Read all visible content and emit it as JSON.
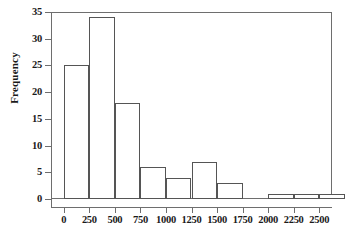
{
  "chart_data": {
    "type": "bar",
    "title": "",
    "subtitle": "",
    "xlabel": "",
    "ylabel": "Frequency",
    "grid": false,
    "legend": null,
    "bin_width": 250,
    "bin_starts": [
      0,
      250,
      500,
      750,
      1000,
      1250,
      1500,
      1750,
      2000,
      2250,
      2500
    ],
    "categories": [
      "0",
      "250",
      "500",
      "750",
      "1000",
      "1250",
      "1500",
      "1750",
      "2000",
      "2250",
      "2500"
    ],
    "values": [
      25,
      34,
      18,
      6,
      4,
      7,
      3,
      0,
      1,
      1,
      1
    ],
    "xlim": [
      -125,
      2625
    ],
    "ylim": [
      0,
      35
    ],
    "xticks": [
      0,
      250,
      500,
      750,
      1000,
      1250,
      1500,
      1750,
      2000,
      2250,
      2500
    ],
    "xtick_labels": [
      "0",
      "250",
      "500",
      "750",
      "1000",
      "1250",
      "1500",
      "1750",
      "2000",
      "2250",
      "2500"
    ],
    "yticks": [
      0,
      5,
      10,
      15,
      20,
      25,
      30,
      35
    ],
    "ytick_labels": [
      "0",
      "5",
      "10",
      "15",
      "20",
      "25",
      "30",
      "35"
    ],
    "colors": {
      "bar_fill": "#ffffff",
      "bar_stroke": "#555555",
      "axis": "#6e6e6e",
      "text": "#1a1a1a",
      "background": "#ffffff"
    }
  }
}
